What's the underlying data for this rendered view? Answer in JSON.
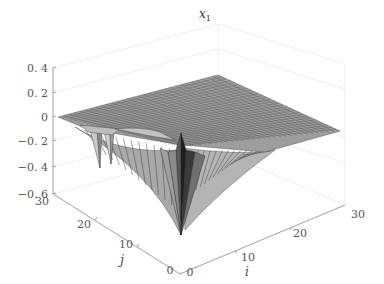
{
  "chart_data": {
    "type": "surface3d",
    "title": "x1",
    "title_display": "x",
    "title_subscript": "1",
    "xlabel": "i",
    "ylabel": "j",
    "zlabel": "",
    "xlim": [
      0,
      30
    ],
    "ylim": [
      0,
      30
    ],
    "zlim": [
      -0.6,
      0.4
    ],
    "x_ticks": [
      "0",
      "10",
      "20",
      "30"
    ],
    "y_ticks": [
      "0",
      "10",
      "20",
      "30"
    ],
    "z_ticks": [
      "0.4",
      "0.2",
      "0",
      "-0.2",
      "-0.4",
      "-0.6"
    ],
    "z_ticks_display": [
      "0. 4",
      "0. 2",
      "0",
      "−0. 2",
      "−0. 4",
      "−0. 6"
    ],
    "grid": true,
    "colormap": "gray",
    "features": [
      {
        "name": "flat-plateau",
        "z": 0.0
      },
      {
        "name": "main-spike",
        "i": 0,
        "j": 0,
        "z_min": -0.55
      },
      {
        "name": "secondary-dips",
        "i_range": [
          0,
          5
        ],
        "j_range": [
          15,
          22
        ],
        "z_min": -0.3
      }
    ]
  }
}
